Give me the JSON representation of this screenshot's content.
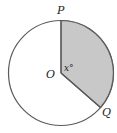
{
  "diagram": {
    "type": "circle-sector",
    "center_label": "O",
    "point_top_label": "P",
    "point_right_label": "Q",
    "angle_label": "x°",
    "colors": {
      "stroke": "#5a5a5a",
      "sector_fill": "#c8c8c8",
      "background": "#ffffff",
      "text": "#222222"
    }
  }
}
